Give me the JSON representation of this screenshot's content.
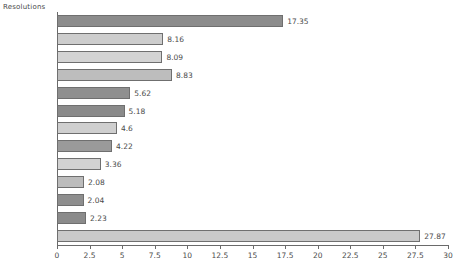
{
  "chart_data": {
    "type": "bar",
    "orientation": "horizontal",
    "title": "",
    "xlabel": "",
    "ylabel": "Resolutions",
    "axis_header": "Resolutions",
    "xlim": [
      0,
      30
    ],
    "xticks": [
      0,
      2.5,
      5,
      7.5,
      10,
      12.5,
      15,
      17.5,
      20,
      22.5,
      25,
      27.5,
      30
    ],
    "xtick_labels": [
      "0",
      "2.5",
      "5",
      "7.5",
      "10",
      "12.5",
      "15",
      "17.5",
      "20",
      "22.5",
      "25",
      "27.5",
      "30"
    ],
    "grid": false,
    "legend": false,
    "categories": [
      "360x640",
      "768x1024",
      "320x568",
      "480x800",
      "unknown",
      "320x480",
      "720x1280",
      "375x667",
      "320x534",
      "240x320",
      "540x960",
      "480x854",
      "others"
    ],
    "values": [
      17.35,
      8.16,
      8.09,
      8.83,
      5.62,
      5.18,
      4.6,
      4.22,
      3.36,
      2.08,
      2.04,
      2.23,
      27.87
    ],
    "value_labels": [
      "17.35",
      "8.16",
      "8.09",
      "8.83",
      "5.62",
      "5.18",
      "4.6",
      "4.22",
      "3.36",
      "2.08",
      "2.04",
      "2.23",
      "27.87"
    ],
    "bar_colors": [
      "#8c8c8c",
      "#cdcdcd",
      "#d3d3d3",
      "#bdbdbd",
      "#8f8f8f",
      "#8a8a8a",
      "#cfcfcf",
      "#9a9a9a",
      "#d2d2d2",
      "#bcbcbc",
      "#8e8e8e",
      "#8b8b8b",
      "#c9c9c9"
    ]
  },
  "colors": {
    "axis": "#6a6a6a",
    "text": "#4a4a4a",
    "bar_edge": "#6f6f6f",
    "background": "#ffffff"
  }
}
